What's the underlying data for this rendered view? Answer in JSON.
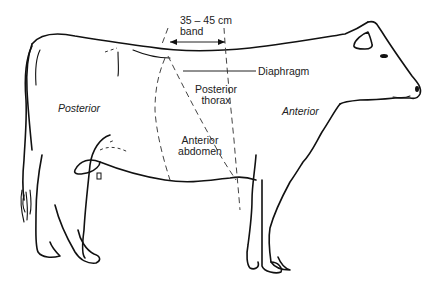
{
  "diagram": {
    "labels": {
      "band_measure": "35 – 45 cm",
      "band_word": "band",
      "diaphragm": "Diaphragm",
      "posterior_thorax_1": "Posterior",
      "posterior_thorax_2": "thorax",
      "anterior_abdomen_1": "Anterior",
      "anterior_abdomen_2": "abdomen",
      "posterior_region": "Posterior",
      "anterior_region": "Anterior"
    },
    "colors": {
      "line": "#111111",
      "dashed": "#444444",
      "text": "#222222",
      "background": "#ffffff"
    }
  }
}
